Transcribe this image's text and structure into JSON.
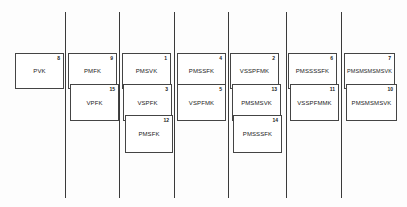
{
  "diagram": {
    "line_color": "#3a3a3a",
    "box_border_color": "#444444",
    "vertical_lines_x": [
      65,
      119,
      174,
      228,
      286,
      341
    ],
    "columns": [
      {
        "boxes": [
          {
            "label": "PVK",
            "number": "8"
          }
        ]
      },
      {
        "boxes": [
          {
            "label": "PMFK",
            "number": "9"
          },
          {
            "label": "VPFK",
            "number": "15"
          }
        ]
      },
      {
        "boxes": [
          {
            "label": "PMSVK",
            "number": "1"
          },
          {
            "label": "VSPFK",
            "number": "3"
          },
          {
            "label": "PMSFK",
            "number": "12"
          }
        ]
      },
      {
        "boxes": [
          {
            "label": "PMSSFK",
            "number": "4"
          },
          {
            "label": "VSPFMK",
            "number": "5"
          }
        ]
      },
      {
        "boxes": [
          {
            "label": "VSSPFMK",
            "number": "2"
          },
          {
            "label": "PMSMSVK",
            "number": "13"
          },
          {
            "label": "PMSSSFK",
            "number": "14"
          }
        ]
      },
      {
        "boxes": [
          {
            "label": "PMSSSSFK",
            "number": "6"
          },
          {
            "label": "VSSPFMMK",
            "number": "11"
          }
        ]
      },
      {
        "boxes": [
          {
            "label": "PMSMSMSMSVK",
            "number": "7"
          },
          {
            "label": "PMSMSMSVK",
            "number": "10"
          }
        ]
      }
    ]
  }
}
